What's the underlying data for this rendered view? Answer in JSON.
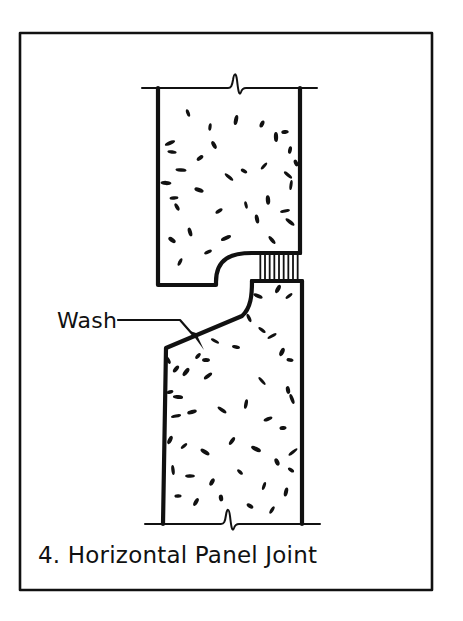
{
  "sheet": {
    "background_color": "#ffffff",
    "ink_color": "#111111",
    "border": {
      "name": "drawing-frame",
      "x": 20,
      "y": 33,
      "width": 412,
      "height": 557,
      "stroke_width": 2.6
    }
  },
  "caption": {
    "number": "4.",
    "title": "Horizontal Panel Joint",
    "full_text": "4. Horizontal Panel Joint",
    "x": 38,
    "y": 563
  },
  "annotations": [
    {
      "name": "wash-callout",
      "label": "Wash",
      "label_x": 57,
      "label_y": 328,
      "leader": {
        "name": "wash-leader-line",
        "points": "118,320 180,320 196,338",
        "arrow_tip": [
          203,
          348
        ],
        "stroke_width": 2.2
      }
    }
  ],
  "drawing": {
    "type": "architectural-section-detail",
    "subject": "precast concrete horizontal panel joint with wash and sealant",
    "upper_panel": {
      "name": "upper-concrete-panel",
      "left_edge_x": 158,
      "right_edge_x": 300,
      "top_y": 88,
      "soffit_y": 285,
      "notch_step_x": 222,
      "recess_corner_radius": 30,
      "outline": "M158,88 L158,285 L216,285 L216,282 C216,258 232,253 252,253 L300,253 L300,88 Z",
      "stroke_width": 4.2,
      "fill": "#ffffff"
    },
    "lower_panel": {
      "name": "lower-concrete-panel",
      "left_edge_x": 163,
      "right_edge_x": 302,
      "bottom_y": 524,
      "tongue_top_y": 281,
      "tongue_left_x": 252,
      "wash_start_x": 166,
      "wash_start_y": 348,
      "wash_end_x": 239,
      "wash_end_y": 322,
      "outline": "M252,281 L302,281 L302,524 L163,524 L166,348 L239,322 C249,318 252,310 252,300 Z",
      "stroke_width": 4.2,
      "fill": "#ffffff"
    },
    "sealant_joint": {
      "name": "sealant-joint-hatch",
      "x_start": 258,
      "x_end": 300,
      "y_top": 253,
      "y_bottom": 281,
      "hatch_line_count": 9,
      "hatch_stroke_width": 1.8,
      "orientation": "vertical"
    },
    "break_lines": [
      {
        "name": "break-line-top",
        "y": 88,
        "x_start": 142,
        "x_end": 317,
        "zigzag_center_x": 235,
        "stroke_width": 2.0
      },
      {
        "name": "break-line-bottom",
        "y": 524,
        "x_start": 145,
        "x_end": 320,
        "zigzag_center_x": 228,
        "stroke_width": 2.0
      }
    ],
    "aggregate_stipple": {
      "name": "concrete-aggregate-stipple",
      "description": "small teardrop aggregate marks denoting concrete in section",
      "mark_count_upper": 34,
      "mark_count_lower": 46,
      "upper_marks": [
        [
          188,
          113
        ],
        [
          210,
          127
        ],
        [
          262,
          124
        ],
        [
          276,
          137
        ],
        [
          285,
          132
        ],
        [
          170,
          143
        ],
        [
          172,
          152
        ],
        [
          214,
          145
        ],
        [
          236,
          120
        ],
        [
          290,
          150
        ],
        [
          244,
          171
        ],
        [
          288,
          175
        ],
        [
          291,
          185
        ],
        [
          174,
          198
        ],
        [
          177,
          207
        ],
        [
          268,
          200
        ],
        [
          229,
          177
        ],
        [
          190,
          232
        ],
        [
          226,
          238
        ],
        [
          257,
          219
        ],
        [
          285,
          211
        ],
        [
          290,
          222
        ],
        [
          199,
          190
        ],
        [
          246,
          205
        ],
        [
          181,
          170
        ],
        [
          264,
          166
        ],
        [
          296,
          163
        ],
        [
          200,
          158
        ],
        [
          219,
          211
        ],
        [
          272,
          240
        ],
        [
          166,
          183
        ],
        [
          208,
          252
        ],
        [
          180,
          262
        ],
        [
          172,
          240
        ]
      ],
      "lower_marks": [
        [
          258,
          296
        ],
        [
          278,
          289
        ],
        [
          289,
          296
        ],
        [
          249,
          318
        ],
        [
          262,
          330
        ],
        [
          215,
          341
        ],
        [
          236,
          347
        ],
        [
          198,
          356
        ],
        [
          206,
          360
        ],
        [
          176,
          369
        ],
        [
          186,
          372
        ],
        [
          208,
          376
        ],
        [
          272,
          336
        ],
        [
          282,
          352
        ],
        [
          290,
          360
        ],
        [
          170,
          392
        ],
        [
          178,
          397
        ],
        [
          262,
          381
        ],
        [
          288,
          390
        ],
        [
          292,
          399
        ],
        [
          176,
          416
        ],
        [
          192,
          412
        ],
        [
          222,
          410
        ],
        [
          246,
          404
        ],
        [
          268,
          419
        ],
        [
          283,
          428
        ],
        [
          170,
          440
        ],
        [
          184,
          446
        ],
        [
          205,
          452
        ],
        [
          232,
          441
        ],
        [
          256,
          449
        ],
        [
          277,
          462
        ],
        [
          291,
          470
        ],
        [
          173,
          470
        ],
        [
          190,
          476
        ],
        [
          212,
          482
        ],
        [
          240,
          472
        ],
        [
          264,
          486
        ],
        [
          286,
          492
        ],
        [
          178,
          496
        ],
        [
          196,
          502
        ],
        [
          221,
          498
        ],
        [
          250,
          506
        ],
        [
          272,
          510
        ],
        [
          293,
          452
        ],
        [
          168,
          360
        ]
      ]
    }
  },
  "icons": {
    "break_symbol": "zigzag-break-icon",
    "arrow_head": "leader-arrowhead-icon"
  }
}
